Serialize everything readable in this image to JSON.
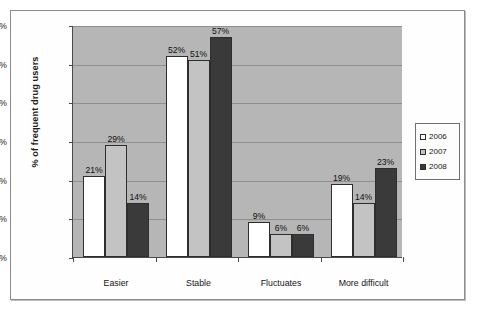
{
  "chart_data": {
    "type": "bar",
    "title": "",
    "subtitle": "",
    "xlabel": "",
    "ylabel": "% of frequent drug users",
    "ylim": [
      0,
      60
    ],
    "ytick_labels": [
      "0%",
      "10%",
      "20%",
      "30%",
      "40%",
      "50%",
      "60%"
    ],
    "ytick_values": [
      0,
      10,
      20,
      30,
      40,
      50,
      60
    ],
    "grid": true,
    "legend_position": "right-outside",
    "categories": [
      "Easier",
      "Stable",
      "Fluctuates",
      "More difficult"
    ],
    "series": [
      {
        "name": "2006",
        "color": "#ffffff",
        "values": [
          21,
          52,
          9,
          19
        ],
        "value_labels": [
          "21%",
          "52%",
          "9%",
          "19%"
        ]
      },
      {
        "name": "2007",
        "color": "#c3c3c3",
        "values": [
          29,
          51,
          6,
          14
        ],
        "value_labels": [
          "29%",
          "51%",
          "6%",
          "14%"
        ]
      },
      {
        "name": "2008",
        "color": "#3a3a3a",
        "values": [
          14,
          57,
          6,
          23
        ],
        "value_labels": [
          "14%",
          "57%",
          "6%",
          "23%"
        ]
      }
    ],
    "plot_background": "#b6b6b6",
    "axis_color": "#4a4a4a"
  },
  "legend": {
    "entries": [
      {
        "label": "2006",
        "series": "s2006"
      },
      {
        "label": "2007",
        "series": "s2007"
      },
      {
        "label": "2008",
        "series": "s2008"
      }
    ]
  }
}
